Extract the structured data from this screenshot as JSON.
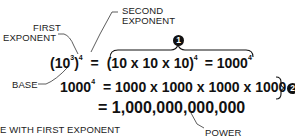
{
  "labels": {
    "first_exponent_line1": "FIRST",
    "first_exponent_line2": "EXPONENT",
    "second_exponent_line1": "SECOND",
    "second_exponent_line2": "EXPONENT",
    "base": "BASE",
    "bottom_left": "E WITH FIRST EXPONENT",
    "power": "POWER"
  },
  "equations": {
    "row1": {
      "lhs_open": "(10",
      "lhs_inner_exp": "3",
      "lhs_close": ")",
      "lhs_outer_exp": "4",
      "eq": "=",
      "rhs_main": "(10 x 10 x 10)",
      "rhs_exp": "4",
      "rhs_eq": "= 1000",
      "rhs_result_exp": "4"
    },
    "row2": {
      "lhs": "1000",
      "lhs_exp": "4",
      "rhs": "=  1000 x 1000 x 1000 x 1000"
    },
    "row3": {
      "rhs": "= 1,000,000,000,000"
    }
  },
  "markers": {
    "one": "1",
    "two": "2"
  }
}
